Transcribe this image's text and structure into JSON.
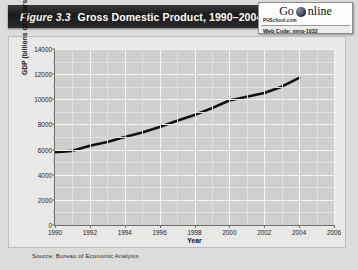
{
  "header": {
    "figure_label": "Figure 3.3",
    "title": "Gross Domestic Product, 1990–2004"
  },
  "badge": {
    "go_text": "Go",
    "online_text": "nline",
    "globe_icon": "globe-icon",
    "site": "PHSchool.com",
    "web_code": "Web Code: mng-1032"
  },
  "source": "Source: Bureau of Economic Analysis",
  "colors": {
    "title_bar": "#1a1a1a",
    "plot_background": "#cfcfcd",
    "gridline": "#f4f4f2",
    "series_line": "#111111",
    "panel_background": "#e8e8e6"
  },
  "chart_data": {
    "type": "line",
    "title": "Gross Domestic Product, 1990–2004",
    "xlabel": "Year",
    "ylabel": "GDP (billions of dollars)",
    "xlim": [
      1990,
      2006
    ],
    "ylim": [
      0,
      14000
    ],
    "xticks": [
      1990,
      1992,
      1994,
      1996,
      1998,
      2000,
      2002,
      2004,
      2006
    ],
    "yticks": [
      0,
      2000,
      4000,
      6000,
      8000,
      10000,
      12000,
      14000
    ],
    "y_minor_ticks": [
      1000,
      3000,
      5000,
      7000,
      9000,
      11000,
      13000
    ],
    "grid": true,
    "legend": null,
    "series": [
      {
        "name": "GDP",
        "x": [
          1990,
          1991,
          1992,
          1993,
          1994,
          1995,
          1996,
          1997,
          1998,
          1999,
          2000,
          2001,
          2002,
          2003,
          2004
        ],
        "values": [
          5800,
          5900,
          6300,
          6600,
          7000,
          7350,
          7800,
          8300,
          8750,
          9300,
          9900,
          10200,
          10500,
          11000,
          11700
        ]
      }
    ]
  }
}
